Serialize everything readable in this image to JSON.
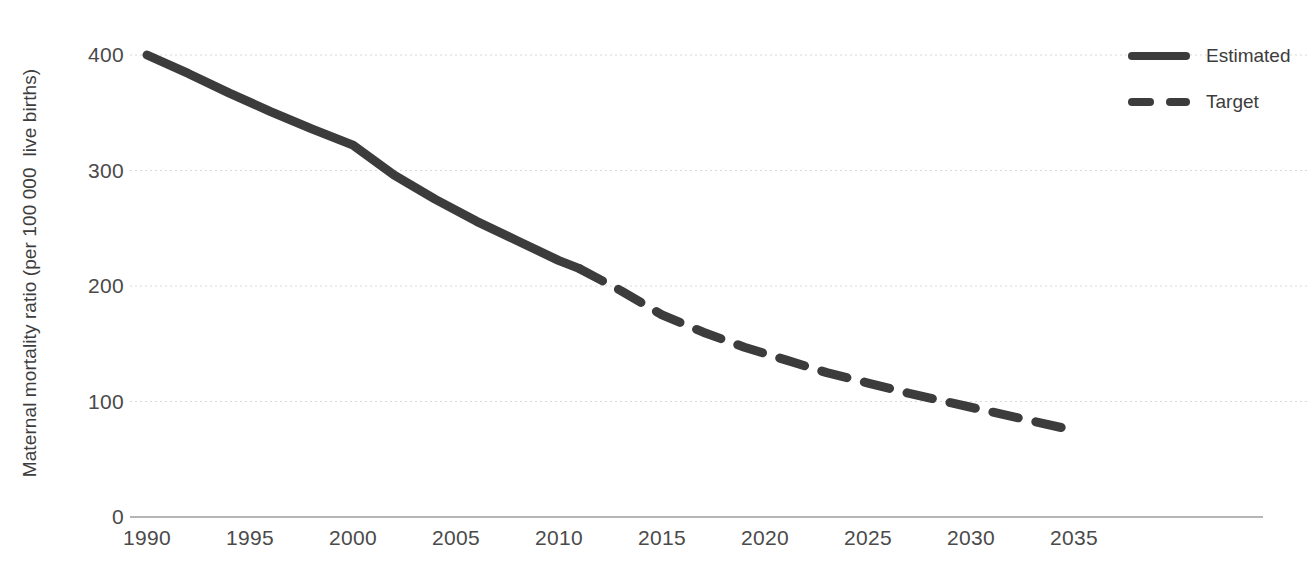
{
  "chart_data": {
    "type": "line",
    "title": "",
    "xlabel": "",
    "ylabel": "Maternal mortality ratio (per 100 000  live births)",
    "xlim": [
      1990,
      2037
    ],
    "ylim": [
      0,
      400
    ],
    "grid": true,
    "xticks": [
      "1990",
      "1995",
      "2000",
      "2005",
      "2010",
      "2015",
      "2020",
      "2025",
      "2030",
      "2035"
    ],
    "xtick_values": [
      1990,
      1995,
      2000,
      2005,
      2010,
      2015,
      2020,
      2025,
      2030,
      2035
    ],
    "yticks": [
      "0",
      "100",
      "200",
      "300",
      "400"
    ],
    "ytick_values": [
      0,
      100,
      200,
      300,
      400
    ],
    "legend_position": "right-top",
    "series": [
      {
        "name": "Estimated",
        "style": "solid",
        "color": "#3c3c3c",
        "x": [
          1990,
          1992,
          1994,
          1996,
          1998,
          2000,
          2002,
          2004,
          2006,
          2008,
          2010,
          2011
        ],
        "values": [
          400,
          384,
          367,
          351,
          336,
          322,
          296,
          275,
          256,
          239,
          222,
          215
        ]
      },
      {
        "name": "Target",
        "style": "dashed",
        "color": "#3c3c3c",
        "x": [
          2011,
          2013,
          2015,
          2017,
          2019,
          2021,
          2023,
          2025,
          2027,
          2029,
          2031,
          2033,
          2035
        ],
        "values": [
          215,
          196,
          175,
          160,
          147,
          136,
          125,
          116,
          107,
          99,
          91,
          83,
          75
        ]
      }
    ]
  },
  "legend": {
    "items": [
      {
        "label": "Estimated",
        "dash": false
      },
      {
        "label": "Target",
        "dash": true
      }
    ]
  }
}
